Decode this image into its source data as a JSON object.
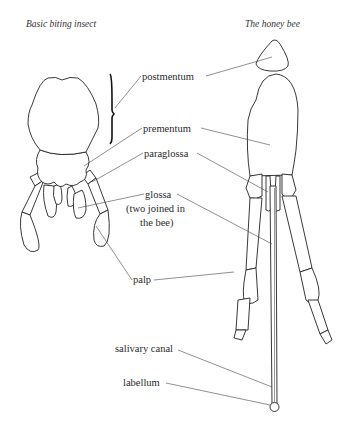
{
  "titles": {
    "left": "Basic biting insect",
    "right": "The honey bee"
  },
  "labels": {
    "postmentum": "postmentum",
    "prementum": "prementum",
    "paraglossa": "paraglossa",
    "glossa_line1": "glossa",
    "glossa_line2": "(two joined in",
    "glossa_line3": "the bee)",
    "palp": "palp",
    "salivary_canal": "salivary canal",
    "labellum": "labellum"
  }
}
